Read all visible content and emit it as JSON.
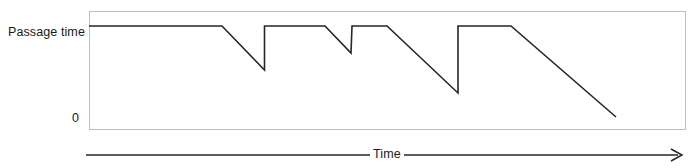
{
  "figure": {
    "title": "",
    "y_axis_label": "Passage time",
    "y_zero_label": "0",
    "x_axis_label": "Time"
  },
  "colors": {
    "line": "#262626",
    "plot_border": "#bfbfbf",
    "axis_arrow": "#262626",
    "background": "#ffffff",
    "text": "#1a1a1a"
  },
  "chart_data": {
    "type": "line",
    "title": "",
    "xlabel": "Time",
    "ylabel": "Passage time",
    "xlim": [
      0,
      100
    ],
    "ylim": [
      0,
      100
    ],
    "grid": false,
    "legend": false,
    "axis_ticks": {
      "x": [],
      "y": [
        "0"
      ]
    },
    "series": [
      {
        "name": "Passage time",
        "points": [
          {
            "x": 0.0,
            "y": 87.3
          },
          {
            "x": 22.3,
            "y": 87.3
          },
          {
            "x": 29.5,
            "y": 50.0
          },
          {
            "x": 29.5,
            "y": 87.3
          },
          {
            "x": 39.6,
            "y": 87.3
          },
          {
            "x": 43.9,
            "y": 64.4
          },
          {
            "x": 44.1,
            "y": 87.3
          },
          {
            "x": 50.0,
            "y": 87.3
          },
          {
            "x": 61.9,
            "y": 30.5
          },
          {
            "x": 61.9,
            "y": 87.3
          },
          {
            "x": 70.8,
            "y": 87.3
          },
          {
            "x": 88.4,
            "y": 10.2
          }
        ]
      }
    ],
    "resets": [
      {
        "x": 29.5,
        "from_y": 50.0,
        "to_y": 87.3
      },
      {
        "x": 43.9,
        "from_y": 64.4,
        "to_y": 87.3
      },
      {
        "x": 61.9,
        "from_y": 30.5,
        "to_y": 87.3
      }
    ],
    "pixel_geometry": {
      "plot_box": {
        "left": 89,
        "top": 11,
        "right": 685,
        "bottom": 129
      },
      "line_path": "M 89,26 L 222,26 L 264.5,70 L 264.5,26 L 325,26 L 351,53 L 352,26 L 387,26 L 458,93 L 458,26 L 511,26 L 616,117",
      "x_arrow": {
        "x1": 86,
        "y1": 155,
        "x2": 682,
        "y2": 155
      }
    }
  }
}
